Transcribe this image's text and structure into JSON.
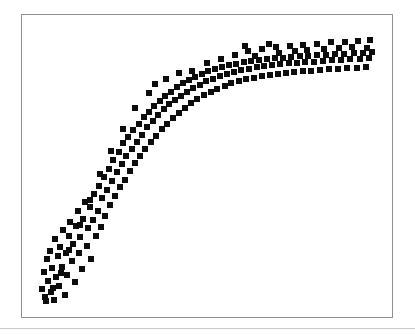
{
  "figure": {
    "background_color": "#ffffff",
    "width": 415,
    "height": 334,
    "title": "",
    "bottom_rule": {
      "y": 328,
      "height": 1,
      "color": "#c9c9cf"
    }
  },
  "plot_frame": {
    "x": 21,
    "y": 14,
    "width": 372,
    "height": 304,
    "border_color": "#8e8e94",
    "border_width": 1,
    "background_color": "#ffffff"
  },
  "marker_style": {
    "shape": "square",
    "color": "#0d0d0d",
    "size_px": 6
  },
  "chart_data": {
    "type": "scatter",
    "title": "",
    "xlabel": "",
    "ylabel": "",
    "grid": false,
    "legend": null,
    "xlim": [
      0,
      100
    ],
    "ylim": [
      0,
      100
    ],
    "n_points": 192,
    "pattern": "saturating logarithmic rise with widening vertical scatter toward the right",
    "series": [
      {
        "name": "observations",
        "marker": "square",
        "color": "#0d0d0d",
        "points": [
          [
            2.1,
            6.1
          ],
          [
            2.6,
            12.4
          ],
          [
            3.0,
            3.2
          ],
          [
            3.4,
            16.9
          ],
          [
            3.9,
            9.0
          ],
          [
            4.3,
            19.8
          ],
          [
            4.6,
            5.0
          ],
          [
            5.0,
            13.6
          ],
          [
            5.4,
            2.2
          ],
          [
            5.8,
            24.1
          ],
          [
            6.2,
            10.5
          ],
          [
            6.6,
            17.8
          ],
          [
            7.0,
            7.4
          ],
          [
            7.4,
            21.0
          ],
          [
            7.8,
            14.2
          ],
          [
            8.2,
            27.3
          ],
          [
            8.6,
            4.1
          ],
          [
            9.0,
            19.0
          ],
          [
            9.4,
            11.2
          ],
          [
            9.8,
            25.0
          ],
          [
            10.3,
            30.2
          ],
          [
            10.7,
            16.0
          ],
          [
            11.1,
            22.4
          ],
          [
            11.5,
            8.6
          ],
          [
            12.0,
            28.5
          ],
          [
            12.4,
            34.1
          ],
          [
            12.8,
            18.9
          ],
          [
            13.2,
            24.8
          ],
          [
            13.7,
            13.5
          ],
          [
            14.1,
            31.0
          ],
          [
            14.6,
            37.2
          ],
          [
            15.0,
            21.6
          ],
          [
            15.5,
            27.9
          ],
          [
            15.9,
            35.4
          ],
          [
            16.4,
            16.8
          ],
          [
            16.8,
            30.7
          ],
          [
            17.3,
            40.1
          ],
          [
            17.7,
            25.2
          ],
          [
            18.2,
            33.9
          ],
          [
            18.6,
            43.0
          ],
          [
            19.1,
            28.4
          ],
          [
            19.5,
            38.6
          ],
          [
            20.0,
            46.2
          ],
          [
            20.5,
            32.1
          ],
          [
            21.0,
            41.5
          ],
          [
            21.4,
            49.0
          ],
          [
            21.9,
            36.0
          ],
          [
            22.4,
            44.8
          ],
          [
            22.8,
            52.1
          ],
          [
            23.3,
            39.4
          ],
          [
            23.8,
            47.9
          ],
          [
            24.3,
            55.0
          ],
          [
            24.7,
            42.6
          ],
          [
            25.2,
            50.8
          ],
          [
            25.7,
            58.2
          ],
          [
            26.2,
            45.0
          ],
          [
            26.6,
            53.6
          ],
          [
            27.1,
            60.4
          ],
          [
            27.6,
            48.2
          ],
          [
            28.1,
            56.1
          ],
          [
            28.6,
            62.8
          ],
          [
            29.1,
            50.9
          ],
          [
            29.6,
            58.7
          ],
          [
            30.1,
            65.0
          ],
          [
            30.6,
            53.5
          ],
          [
            31.1,
            61.2
          ],
          [
            31.6,
            67.3
          ],
          [
            32.1,
            56.0
          ],
          [
            32.6,
            63.8
          ],
          [
            33.1,
            69.4
          ],
          [
            33.7,
            58.6
          ],
          [
            34.2,
            66.0
          ],
          [
            34.7,
            71.2
          ],
          [
            35.2,
            60.8
          ],
          [
            35.8,
            68.1
          ],
          [
            36.3,
            73.0
          ],
          [
            36.8,
            63.0
          ],
          [
            37.4,
            70.2
          ],
          [
            37.9,
            74.8
          ],
          [
            38.5,
            65.1
          ],
          [
            39.0,
            72.0
          ],
          [
            39.6,
            76.4
          ],
          [
            40.1,
            67.0
          ],
          [
            40.7,
            73.6
          ],
          [
            41.3,
            78.0
          ],
          [
            41.9,
            69.0
          ],
          [
            42.4,
            75.1
          ],
          [
            43.0,
            79.4
          ],
          [
            43.6,
            70.8
          ],
          [
            44.2,
            76.5
          ],
          [
            44.8,
            80.6
          ],
          [
            45.4,
            72.4
          ],
          [
            46.0,
            77.8
          ],
          [
            46.6,
            81.8
          ],
          [
            47.2,
            73.9
          ],
          [
            47.9,
            79.0
          ],
          [
            48.5,
            82.8
          ],
          [
            49.1,
            75.2
          ],
          [
            49.8,
            80.1
          ],
          [
            50.4,
            83.7
          ],
          [
            51.1,
            76.4
          ],
          [
            51.7,
            81.1
          ],
          [
            52.4,
            84.5
          ],
          [
            53.0,
            77.5
          ],
          [
            53.7,
            82.0
          ],
          [
            54.4,
            85.2
          ],
          [
            55.1,
            78.5
          ],
          [
            55.8,
            82.8
          ],
          [
            56.4,
            85.9
          ],
          [
            57.1,
            79.4
          ],
          [
            57.8,
            83.5
          ],
          [
            58.5,
            86.4
          ],
          [
            59.2,
            80.2
          ],
          [
            60.0,
            84.1
          ],
          [
            60.7,
            86.9
          ],
          [
            61.4,
            80.9
          ],
          [
            62.1,
            84.6
          ],
          [
            62.9,
            87.3
          ],
          [
            63.6,
            81.5
          ],
          [
            64.4,
            85.1
          ],
          [
            65.1,
            87.7
          ],
          [
            65.9,
            82.0
          ],
          [
            66.6,
            85.5
          ],
          [
            67.4,
            88.0
          ],
          [
            68.2,
            82.5
          ],
          [
            68.9,
            85.9
          ],
          [
            69.7,
            88.3
          ],
          [
            70.5,
            82.9
          ],
          [
            71.3,
            86.2
          ],
          [
            72.1,
            88.6
          ],
          [
            72.9,
            83.2
          ],
          [
            73.7,
            86.5
          ],
          [
            74.5,
            88.8
          ],
          [
            75.3,
            83.5
          ],
          [
            76.1,
            86.8
          ],
          [
            76.9,
            89.0
          ],
          [
            77.8,
            83.8
          ],
          [
            78.6,
            87.0
          ],
          [
            79.4,
            89.2
          ],
          [
            80.3,
            84.0
          ],
          [
            81.1,
            87.2
          ],
          [
            82.0,
            89.4
          ],
          [
            82.8,
            84.2
          ],
          [
            83.7,
            87.4
          ],
          [
            84.6,
            89.6
          ],
          [
            85.4,
            84.4
          ],
          [
            86.3,
            87.6
          ],
          [
            87.2,
            89.8
          ],
          [
            88.1,
            84.6
          ],
          [
            89.0,
            87.8
          ],
          [
            89.9,
            90.0
          ],
          [
            90.8,
            84.8
          ],
          [
            91.7,
            88.0
          ],
          [
            92.6,
            90.2
          ],
          [
            93.5,
            85.0
          ],
          [
            94.4,
            88.2
          ],
          [
            95.3,
            90.4
          ],
          [
            96.2,
            85.2
          ],
          [
            97.1,
            88.4
          ],
          [
            98.0,
            90.6
          ],
          [
            35.0,
            79.2
          ],
          [
            38.0,
            81.0
          ],
          [
            42.0,
            83.0
          ],
          [
            45.5,
            84.0
          ],
          [
            50.0,
            86.5
          ],
          [
            54.0,
            88.2
          ],
          [
            58.0,
            89.5
          ],
          [
            62.0,
            90.8
          ],
          [
            66.0,
            91.5
          ],
          [
            70.0,
            92.2
          ],
          [
            74.0,
            92.8
          ],
          [
            78.0,
            93.2
          ],
          [
            82.0,
            93.6
          ],
          [
            86.0,
            94.0
          ],
          [
            90.0,
            94.3
          ],
          [
            94.0,
            94.6
          ],
          [
            97.5,
            94.9
          ],
          [
            33.0,
            76.0
          ],
          [
            29.0,
            70.5
          ],
          [
            25.5,
            63.0
          ],
          [
            22.0,
            55.5
          ],
          [
            18.8,
            47.0
          ],
          [
            16.0,
            38.0
          ],
          [
            13.0,
            29.0
          ],
          [
            10.0,
            20.0
          ],
          [
            7.5,
            12.0
          ],
          [
            5.2,
            6.5
          ],
          [
            3.2,
            1.8
          ],
          [
            61.0,
            92.6
          ],
          [
            68.0,
            93.4
          ],
          [
            75.5,
            91.0
          ],
          [
            84.0,
            91.6
          ],
          [
            92.0,
            92.4
          ],
          [
            96.5,
            91.9
          ],
          [
            88.5,
            92.0
          ],
          [
            79.0,
            91.2
          ],
          [
            71.0,
            90.4
          ],
          [
            64.0,
            89.0
          ]
        ]
      }
    ]
  }
}
